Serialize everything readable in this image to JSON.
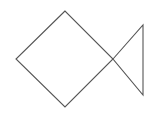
{
  "figure": {
    "background_color": "#ffffff",
    "stroke_color": "#555555",
    "stroke_width": 1.1,
    "canvas": {
      "width": 157,
      "height": 113
    },
    "shapes": [
      {
        "name": "diamond",
        "type": "square-rotated",
        "label": "diamond body",
        "points": "65,11 16,59 65,107 113,59",
        "vertices": [
          {
            "name": "top",
            "x": 65,
            "y": 11
          },
          {
            "name": "left",
            "x": 16,
            "y": 59
          },
          {
            "name": "bottom",
            "x": 65,
            "y": 107
          },
          {
            "name": "right",
            "x": 113,
            "y": 59
          }
        ]
      },
      {
        "name": "triangle",
        "type": "triangle",
        "label": "triangle tail",
        "points": "113,59 143,25 143,95",
        "vertices": [
          {
            "name": "left-apex",
            "x": 113,
            "y": 59
          },
          {
            "name": "top-right",
            "x": 143,
            "y": 25
          },
          {
            "name": "bottom-right",
            "x": 143,
            "y": 95
          }
        ]
      }
    ]
  }
}
